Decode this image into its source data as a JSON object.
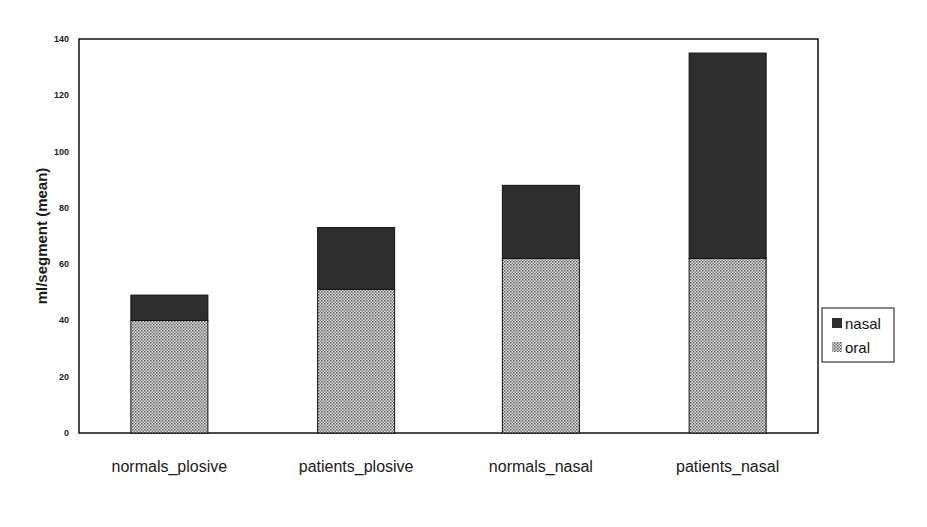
{
  "chart_data": {
    "type": "bar",
    "stacked": true,
    "title": "",
    "xlabel": "",
    "ylabel": "ml/segment (mean)",
    "ylim": [
      0,
      140
    ],
    "yticks": [
      0,
      20,
      40,
      60,
      80,
      100,
      120,
      140
    ],
    "grid": false,
    "legend_position": "right",
    "categories": [
      "normals_plosive",
      "patients_plosive",
      "normals_nasal",
      "patients_nasal"
    ],
    "series": [
      {
        "name": "oral",
        "values": [
          40,
          51,
          62,
          62
        ],
        "pattern": "dotted",
        "color": "#bdbdbd"
      },
      {
        "name": "nasal",
        "values": [
          9,
          22,
          26,
          73
        ],
        "pattern": "solid",
        "color": "#2e2e2e"
      }
    ],
    "legend": [
      {
        "label": "nasal",
        "color": "#2e2e2e"
      },
      {
        "label": "oral",
        "color": "#bdbdbd"
      }
    ]
  }
}
